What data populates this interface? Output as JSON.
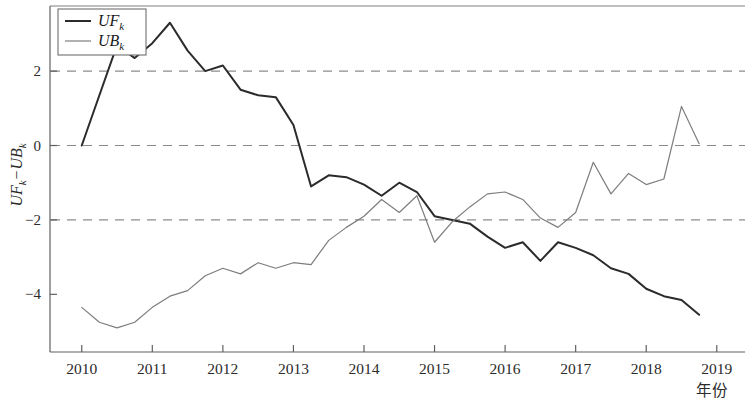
{
  "figure": {
    "y_axis_title": "UF",
    "y_axis_title_sub1": "k",
    "y_axis_title_mid": "−UB",
    "y_axis_title_sub2": "k",
    "x_axis_title": "年份",
    "background_color": "#ffffff",
    "frame_color": "#707070"
  },
  "legend": {
    "position": "top-left-inside",
    "entries": [
      {
        "name": "UF",
        "sub": "k",
        "color": "#2b2b2b",
        "width": 2.0
      },
      {
        "name": "UB",
        "sub": "k",
        "color": "#7d7d7d",
        "width": 1.2
      }
    ]
  },
  "chart_data": {
    "type": "line",
    "title": "",
    "subtitle": "",
    "xlabel": "年份",
    "ylabel": "UF_k−UB_k",
    "xlim": [
      2009.55,
      2019.4
    ],
    "ylim": [
      -5.55,
      3.75
    ],
    "xticks": [
      "2010",
      "2011",
      "2012",
      "2013",
      "2014",
      "2015",
      "2016",
      "2017",
      "2018",
      "2019"
    ],
    "xtick_values": [
      2010,
      2011,
      2012,
      2013,
      2014,
      2015,
      2016,
      2017,
      2018,
      2019
    ],
    "yticks": [
      "2",
      "0",
      "−2",
      "−4"
    ],
    "ytick_values": [
      2,
      0,
      -2,
      -4
    ],
    "grid": false,
    "reference_lines": [
      {
        "y": 2,
        "style": "dashed",
        "color": "#8a8a8a",
        "label": "+1.96 significance"
      },
      {
        "y": 0,
        "style": "dashed",
        "color": "#8a8a8a",
        "label": "zero line"
      },
      {
        "y": -2,
        "style": "dashed",
        "color": "#8a8a8a",
        "label": "-1.96 significance"
      }
    ],
    "legend_position": "upper left",
    "series": [
      {
        "name": "UF",
        "name_sub": "k",
        "color": "#2b2b2b",
        "linewidth": 2.0,
        "x": [
          2010.0,
          2010.25,
          2010.5,
          2010.75,
          2011.0,
          2011.25,
          2011.5,
          2011.75,
          2012.0,
          2012.25,
          2012.5,
          2012.75,
          2013.0,
          2013.25,
          2013.5,
          2013.75,
          2014.0,
          2014.25,
          2014.5,
          2014.75,
          2015.0,
          2015.25,
          2015.5,
          2015.75,
          2016.0,
          2016.25,
          2016.5,
          2016.75,
          2017.0,
          2017.25,
          2017.5,
          2017.75,
          2018.0,
          2018.25,
          2018.5,
          2018.75
        ],
        "y": [
          0.0,
          1.35,
          2.7,
          2.35,
          2.75,
          3.3,
          2.55,
          2.0,
          2.15,
          1.5,
          1.35,
          1.3,
          0.55,
          -1.1,
          -0.8,
          -0.85,
          -1.05,
          -1.35,
          -1.0,
          -1.25,
          -1.9,
          -2.0,
          -2.1,
          -2.45,
          -2.75,
          -2.6,
          -3.1,
          -2.6,
          -2.75,
          -2.95,
          -3.3,
          -3.45,
          -3.85,
          -4.05,
          -4.15,
          -4.55
        ]
      },
      {
        "name": "UB",
        "name_sub": "k",
        "color": "#7d7d7d",
        "linewidth": 1.2,
        "x": [
          2010.0,
          2010.25,
          2010.5,
          2010.75,
          2011.0,
          2011.25,
          2011.5,
          2011.75,
          2012.0,
          2012.25,
          2012.5,
          2012.75,
          2013.0,
          2013.25,
          2013.5,
          2013.75,
          2014.0,
          2014.25,
          2014.5,
          2014.75,
          2015.0,
          2015.25,
          2015.5,
          2015.75,
          2016.0,
          2016.25,
          2016.5,
          2016.75,
          2017.0,
          2017.25,
          2017.5,
          2017.75,
          2018.0,
          2018.25,
          2018.5,
          2018.75
        ],
        "y": [
          -4.35,
          -4.75,
          -4.9,
          -4.75,
          -4.35,
          -4.05,
          -3.9,
          -3.5,
          -3.3,
          -3.45,
          -3.15,
          -3.3,
          -3.15,
          -3.2,
          -2.55,
          -2.2,
          -1.9,
          -1.45,
          -1.8,
          -1.35,
          -2.6,
          -2.05,
          -1.65,
          -1.3,
          -1.25,
          -1.45,
          -1.95,
          -2.2,
          -1.8,
          -0.45,
          -1.3,
          -0.75,
          -1.05,
          -0.9,
          1.05,
          0.05
        ]
      }
    ]
  }
}
